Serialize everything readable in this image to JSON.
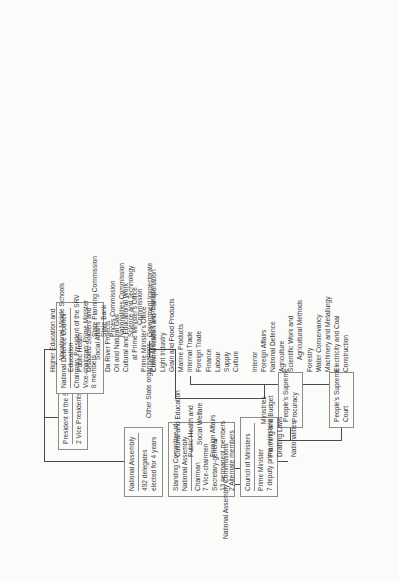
{
  "diagram": {
    "labels": {
      "assembly_commissions": "National Assembly Commissions",
      "ministries": "Ministries",
      "other_state_orgs": "Other State organisations"
    },
    "nodes": {
      "president": {
        "title": "President of the SRV",
        "lines": [
          "2 Vice Presidents"
        ]
      },
      "defence_council": {
        "title": "National Defence Council",
        "lines": [
          "Chairman: President of the SRV",
          "Vice-chairman: Prime Minister",
          "8 members"
        ]
      },
      "national_assembly": {
        "title": "National Assembly",
        "lines": [
          "492 delegates",
          "elected for 4 years"
        ]
      },
      "standing_committee": {
        "title": "Standing Committee of",
        "subtitle": "National Assembly",
        "lines": [
          "Chairman",
          "7 Vice-chairmen",
          "Secretary-general",
          "13 permanent members",
          "2 Alternate members"
        ]
      },
      "council_of_ministers": {
        "title": "Council of Ministers",
        "lines": [
          "Prime Minister",
          "7 deputy prime ministers"
        ]
      },
      "supreme_court": {
        "title": "People's Supreme",
        "lines": [
          "Court"
        ]
      },
      "supreme_procuracy": {
        "title": "People's Supreme",
        "lines": [
          "Procuracy"
        ]
      }
    },
    "assembly_commissions": [
      "Planning and Budget",
      "Drafting Laws",
      "Nationalities",
      "Cultural and Education",
      "Public Health and",
      "Social Welfare",
      "Foreign Affairs"
    ],
    "ministries_col1": [
      "Interior",
      "Foreign Affairs",
      "National Defence",
      "Agriculture",
      "Scientific Work and",
      "Agricultural Methods",
      "Forestry",
      "Water Conservancy",
      "Machinery and Metallurgy",
      "Electricity and Coal",
      "Construction"
    ],
    "ministries_col2": [
      "Communication and Transportation",
      "Light Industry",
      "Grain and Food Products",
      "Marine Products",
      "Internal Trade",
      "Foreign Trade",
      "Finance",
      "Labour",
      "Supply",
      "Culture"
    ],
    "ministries_col3": [
      "Higher Education and",
      "Vocational Middle Schools",
      "Education",
      "Public Health",
      "Disabled Soldiers and",
      "Social Affairs",
      "Da River Projects",
      "Oil and Natural Gas",
      "Cultural and Educational Work",
      "at Prime Minister's Office",
      "Prime Minister's Office",
      "Prime Minister's Secretariat"
    ],
    "other_state_organisations": [
      "State Planning Commission",
      "State Bank",
      "Prices Commission",
      "Nationalities Commission",
      "Science and Technology",
      "Commission",
      "Government Inspectorate"
    ]
  }
}
